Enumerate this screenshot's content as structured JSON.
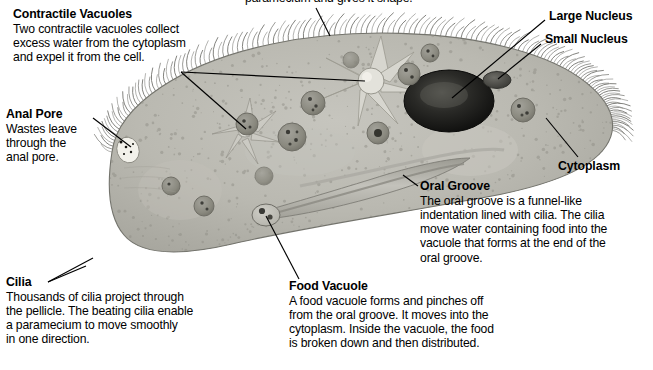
{
  "figure": {
    "subject": "paramecium",
    "colors": {
      "cell_body": "#b9b8b0",
      "cell_body_light": "#c9c8c1",
      "cell_outline": "#6f6f69",
      "macronucleus": "#171715",
      "micronucleus": "#4a4a46",
      "vacuole": "#8d8c84",
      "cilia": "#5c5c57",
      "leader_line": "#000000",
      "text": "#000000",
      "background": "#ffffff"
    }
  },
  "callouts": {
    "top_clipped": {
      "text": "paramecium and gives it shape."
    },
    "contractile_vacuoles": {
      "heading": "Contractile Vacuoles",
      "lines": [
        "Two contractile vacuoles collect",
        "excess water from the cytoplasm",
        "and expel it from the cell."
      ]
    },
    "anal_pore": {
      "heading": "Anal Pore",
      "lines": [
        "Wastes leave",
        "through the",
        "anal pore."
      ]
    },
    "cilia": {
      "heading": "Cilia",
      "lines": [
        "Thousands of cilia project through",
        "the pellicle. The beating cilia enable",
        "a paramecium to move smoothly",
        "in one direction."
      ]
    },
    "large_nucleus": {
      "heading": "Large Nucleus"
    },
    "small_nucleus": {
      "heading": "Small Nucleus"
    },
    "cytoplasm": {
      "heading": "Cytoplasm"
    },
    "oral_groove": {
      "heading": "Oral Groove",
      "lines": [
        "The oral groove is a funnel-like",
        "indentation lined with cilia. The cilia",
        "move water containing food into the",
        "vacuole that forms at the end of the",
        "oral groove."
      ]
    },
    "food_vacuole": {
      "heading": "Food Vacuole",
      "lines": [
        "A food vacuole forms and pinches off",
        "from the oral groove. It moves into the",
        "cytoplasm. Inside the vacuole, the food",
        "is broken down and then distributed."
      ]
    }
  }
}
